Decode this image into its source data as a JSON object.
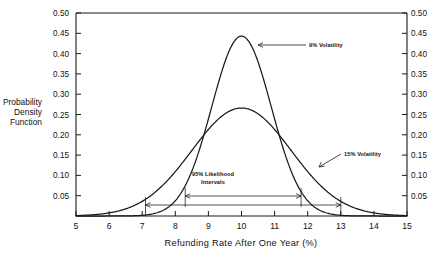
{
  "chart_data": {
    "type": "line",
    "title": "",
    "xlabel": "Refunding Rate After One Year (%)",
    "ylabel": "Probability Density Function",
    "xlim": [
      5,
      15
    ],
    "ylim": [
      0,
      0.5
    ],
    "grid": false,
    "legend_position": "inline-annotations",
    "x_ticks": [
      "5",
      "6",
      "7",
      "8",
      "9",
      "10",
      "11",
      "12",
      "13",
      "14",
      "15"
    ],
    "y_ticks": [
      "0.50",
      "0.45",
      "0.40",
      "0.35",
      "0.30",
      "0.25",
      "0.20",
      "0.15",
      "0.10",
      "0.05"
    ],
    "y_ticks_right": [
      "0.50",
      "0.45",
      "0.40",
      "0.35",
      "0.30",
      "0.25",
      "0.20",
      "0.15",
      "0.10",
      "0.05"
    ],
    "series": [
      {
        "name": "9% Volatility",
        "distribution": "normal",
        "mean": 10,
        "sigma": 0.9,
        "peak_value": 0.443,
        "x": [
          5,
          5.5,
          6,
          6.5,
          7,
          7.5,
          8,
          8.5,
          9,
          9.5,
          10,
          10.5,
          11,
          11.5,
          12,
          12.5,
          13,
          13.5,
          14,
          14.5,
          15
        ],
        "values": [
          0.0,
          0.0,
          0.0001,
          0.0013,
          0.0097,
          0.0455,
          0.1388,
          0.2753,
          0.3545,
          0.2968,
          0.4433,
          0.4031,
          0.3545,
          0.2753,
          0.1388,
          0.0455,
          0.0097,
          0.0013,
          0.0001,
          0.0,
          0.0
        ]
      },
      {
        "name": "15% Volatility",
        "distribution": "normal",
        "mean": 10,
        "sigma": 1.5,
        "peak_value": 0.266,
        "x": [
          5,
          5.5,
          6,
          6.5,
          7,
          7.5,
          8,
          8.5,
          9,
          9.5,
          10,
          10.5,
          11,
          11.5,
          12,
          12.5,
          13,
          13.5,
          14,
          14.5,
          15
        ],
        "values": [
          0.0009,
          0.0035,
          0.0109,
          0.0283,
          0.0622,
          0.1152,
          0.1801,
          0.2384,
          0.266,
          0.2636,
          0.266,
          0.2384,
          0.1801,
          0.1152,
          0.0622,
          0.0283,
          0.0109,
          0.0035,
          0.0009,
          0.0002,
          0.0
        ]
      }
    ],
    "annotations": [
      {
        "name": "9% Volatility",
        "text": "9% Volatility",
        "points_to_series": "9% Volatility"
      },
      {
        "name": "15% Volatility",
        "text": "15% Volatility",
        "points_to_series": "15% Volatility"
      },
      {
        "name": "95% Likelihood Intervals",
        "line1": "95% Likelihood",
        "line2": "Intervals"
      }
    ],
    "intervals": [
      {
        "series": "15% Volatility",
        "label": "95% Likelihood Intervals",
        "low": 8.3,
        "high": 11.8
      },
      {
        "series": "9% Volatility",
        "label": "95% Likelihood Intervals",
        "low": 7.1,
        "high": 13.0
      }
    ]
  },
  "axis": {
    "x_title": "Refunding Rate After One Year (%)",
    "y_title_line1": "Probability",
    "y_title_line2": "Density",
    "y_title_line3": "Function"
  },
  "labels": {
    "series_9": "9% Volatility",
    "series_15": "15% Volatility",
    "interval_line1": "95% Likelihood",
    "interval_line2": "Intervals"
  },
  "colors": {
    "ink": "#1a1a1a",
    "background": "#ffffff"
  }
}
